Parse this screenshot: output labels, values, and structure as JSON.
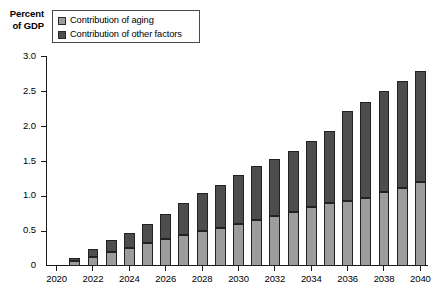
{
  "chart_data": {
    "type": "bar",
    "stacked": true,
    "title": "",
    "subtitle": "",
    "xlabel": "",
    "ylabel": "Percent of GDP",
    "ylabel_lines": [
      "Percent",
      "of GDP"
    ],
    "ylim": [
      0,
      3.0
    ],
    "ytick_values": [
      0,
      0.5,
      1.0,
      1.5,
      2.0,
      2.5,
      3.0
    ],
    "ytick_labels": [
      "0",
      "0.5",
      "1.0",
      "1.5",
      "2.0",
      "2.5",
      "3.0"
    ],
    "grid": false,
    "legend_position": "top-left",
    "xlim": [
      2020,
      2040
    ],
    "xtick_values": [
      2020,
      2022,
      2024,
      2026,
      2028,
      2030,
      2032,
      2034,
      2036,
      2038,
      2040
    ],
    "xtick_labels": [
      "2020",
      "2022",
      "2024",
      "2026",
      "2028",
      "2030",
      "2032",
      "2034",
      "2036",
      "2038",
      "2040"
    ],
    "categories": [
      2020,
      2021,
      2022,
      2023,
      2024,
      2025,
      2026,
      2027,
      2028,
      2029,
      2030,
      2031,
      2032,
      2033,
      2034,
      2035,
      2036,
      2037,
      2038,
      2039,
      2040
    ],
    "series": [
      {
        "name": "Contribution of aging",
        "color": "#9c9c9c",
        "values": [
          0.0,
          0.07,
          0.13,
          0.2,
          0.26,
          0.33,
          0.39,
          0.45,
          0.5,
          0.55,
          0.6,
          0.66,
          0.72,
          0.78,
          0.84,
          0.9,
          0.93,
          0.98,
          1.06,
          1.12,
          1.2
        ]
      },
      {
        "name": "Contribution of other factors",
        "color": "#4d4d4d",
        "values": [
          0.0,
          0.05,
          0.11,
          0.17,
          0.21,
          0.27,
          0.35,
          0.45,
          0.55,
          0.62,
          0.71,
          0.77,
          0.82,
          0.87,
          0.95,
          1.04,
          1.29,
          1.37,
          1.45,
          1.53,
          1.6
        ]
      }
    ],
    "totals": [
      0.0,
      0.12,
      0.24,
      0.37,
      0.47,
      0.6,
      0.74,
      0.9,
      1.05,
      1.17,
      1.31,
      1.43,
      1.54,
      1.65,
      1.79,
      1.94,
      2.22,
      2.35,
      2.51,
      2.65,
      2.8
    ]
  },
  "legend": {
    "items": [
      {
        "label": "Contribution of aging",
        "swatch": "aging"
      },
      {
        "label": "Contribution of other factors",
        "swatch": "other"
      }
    ]
  },
  "colors": {
    "aging": "#9c9c9c",
    "other": "#4d4d4d",
    "axis": "#1a1a1a",
    "background": "#ffffff"
  }
}
